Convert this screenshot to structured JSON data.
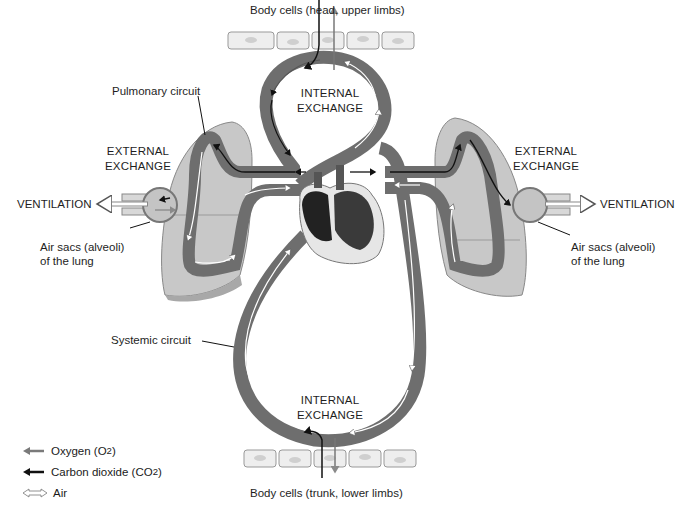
{
  "labels": {
    "body_cells_top": "Body cells (head, upper limbs)",
    "body_cells_bottom": "Body cells (trunk, lower limbs)",
    "internal_exchange_top": [
      "INTERNAL",
      "EXCHANGE"
    ],
    "internal_exchange_bottom": [
      "INTERNAL",
      "EXCHANGE"
    ],
    "external_exchange_left": [
      "EXTERNAL",
      "EXCHANGE"
    ],
    "external_exchange_right": [
      "EXTERNAL",
      "EXCHANGE"
    ],
    "ventilation_left": "VENTILATION",
    "ventilation_right": "VENTILATION",
    "pulmonary_circuit": "Pulmonary circuit",
    "systemic_circuit": "Systemic circuit",
    "air_sacs_left": [
      "Air sacs (alveoli)",
      "of the lung"
    ],
    "air_sacs_right": [
      "Air sacs (alveoli)",
      "of the lung"
    ]
  },
  "legend": [
    {
      "icon": "oxygen-arrow",
      "label": "Oxygen (O",
      "sub": "2",
      "suffix": ")",
      "color": "#7a7a7a"
    },
    {
      "icon": "carbon-dioxide-arrow",
      "label": "Carbon dioxide (CO",
      "sub": "2",
      "suffix": ")",
      "color": "#111111"
    },
    {
      "icon": "air-arrow",
      "label": "Air",
      "sub": "",
      "suffix": "",
      "color": "#ffffff"
    }
  ],
  "colors": {
    "vessel": "#6e6e6e",
    "vessel_dark": "#4a4a4a",
    "lung": "#bdbdbd",
    "lung_dark": "#9a9a9a",
    "heart": "#2a2a2a",
    "cell": "#eeeeee"
  }
}
